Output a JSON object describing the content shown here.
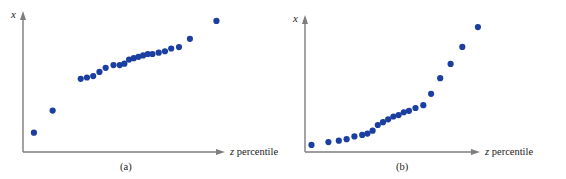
{
  "figure": {
    "background_color": "#ffffff",
    "marker_color": "#1b3fa0",
    "axis_color": "#7d7d7d",
    "text_color": "#1a1a1a"
  },
  "chart_data": [
    {
      "type": "scatter",
      "panel_id": "a",
      "caption": "(a)",
      "title": "",
      "xlabel_prefix": "z",
      "xlabel_suffix": " percentile",
      "xlabel": "z percentile",
      "ylabel": "x",
      "grid": false,
      "legend": "none",
      "xlim": [
        0,
        100
      ],
      "ylim": [
        0,
        100
      ],
      "axis_ticks": false,
      "axis_arrowheads": true,
      "n_points": 22,
      "x": [
        7,
        19,
        37,
        41,
        45,
        49,
        53,
        58,
        62,
        65,
        68,
        71,
        74,
        77,
        80,
        83,
        87,
        91,
        95,
        100,
        107,
        124
      ],
      "y": [
        14,
        30,
        53,
        54,
        55,
        58,
        61,
        63,
        63,
        64,
        67,
        68,
        69,
        70,
        71,
        71,
        72,
        73,
        75,
        76,
        82,
        95
      ],
      "points": [
        {
          "x": 7,
          "y": 14
        },
        {
          "x": 19,
          "y": 30
        },
        {
          "x": 37,
          "y": 53
        },
        {
          "x": 41,
          "y": 54
        },
        {
          "x": 45,
          "y": 55
        },
        {
          "x": 49,
          "y": 58
        },
        {
          "x": 53,
          "y": 61
        },
        {
          "x": 58,
          "y": 63
        },
        {
          "x": 62,
          "y": 63
        },
        {
          "x": 65,
          "y": 64
        },
        {
          "x": 68,
          "y": 67
        },
        {
          "x": 71,
          "y": 68
        },
        {
          "x": 74,
          "y": 69
        },
        {
          "x": 77,
          "y": 70
        },
        {
          "x": 80,
          "y": 71
        },
        {
          "x": 83,
          "y": 71
        },
        {
          "x": 87,
          "y": 72
        },
        {
          "x": 91,
          "y": 73
        },
        {
          "x": 95,
          "y": 75
        },
        {
          "x": 100,
          "y": 76
        },
        {
          "x": 107,
          "y": 82
        },
        {
          "x": 124,
          "y": 95
        }
      ]
    },
    {
      "type": "scatter",
      "panel_id": "b",
      "caption": "(b)",
      "title": "",
      "xlabel_prefix": "z",
      "xlabel_suffix": " percentile",
      "xlabel": "z percentile",
      "ylabel": "x",
      "grid": false,
      "legend": "none",
      "xlim": [
        0,
        100
      ],
      "ylim": [
        0,
        100
      ],
      "axis_ticks": false,
      "axis_arrowheads": true,
      "n_points": 22,
      "x": [
        5,
        18,
        26,
        32,
        38,
        44,
        48,
        52,
        56,
        60,
        64,
        68,
        72,
        76,
        80,
        85,
        91,
        97,
        104,
        112,
        121,
        133
      ],
      "y": [
        5,
        7,
        8,
        9,
        11,
        12,
        13,
        15,
        19,
        21,
        23,
        25,
        26,
        28,
        29,
        31,
        33,
        41,
        52,
        62,
        74,
        88
      ],
      "points": [
        {
          "x": 5,
          "y": 5
        },
        {
          "x": 18,
          "y": 7
        },
        {
          "x": 26,
          "y": 8
        },
        {
          "x": 32,
          "y": 9
        },
        {
          "x": 38,
          "y": 11
        },
        {
          "x": 44,
          "y": 12
        },
        {
          "x": 48,
          "y": 13
        },
        {
          "x": 52,
          "y": 15
        },
        {
          "x": 56,
          "y": 19
        },
        {
          "x": 60,
          "y": 21
        },
        {
          "x": 64,
          "y": 23
        },
        {
          "x": 68,
          "y": 25
        },
        {
          "x": 72,
          "y": 26
        },
        {
          "x": 76,
          "y": 28
        },
        {
          "x": 80,
          "y": 29
        },
        {
          "x": 85,
          "y": 31
        },
        {
          "x": 91,
          "y": 33
        },
        {
          "x": 97,
          "y": 41
        },
        {
          "x": 104,
          "y": 52
        },
        {
          "x": 112,
          "y": 62
        },
        {
          "x": 121,
          "y": 74
        },
        {
          "x": 133,
          "y": 88
        }
      ]
    }
  ]
}
